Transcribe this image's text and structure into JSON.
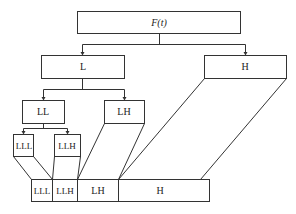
{
  "diagram": {
    "type": "wavelet-decomposition-tree",
    "root": {
      "label": "F(t)"
    },
    "level1": [
      {
        "label": "L"
      },
      {
        "label": "H"
      }
    ],
    "level2": [
      {
        "label": "LL"
      },
      {
        "label": "LH"
      }
    ],
    "level3": [
      {
        "label": "LLL"
      },
      {
        "label": "LLH"
      }
    ],
    "bottom_bar": [
      {
        "label": "LLL"
      },
      {
        "label": "LLH"
      },
      {
        "label": "LH"
      },
      {
        "label": "H"
      }
    ],
    "colors": {
      "stroke": "#333333",
      "text": "#222222",
      "background": "#ffffff"
    }
  }
}
